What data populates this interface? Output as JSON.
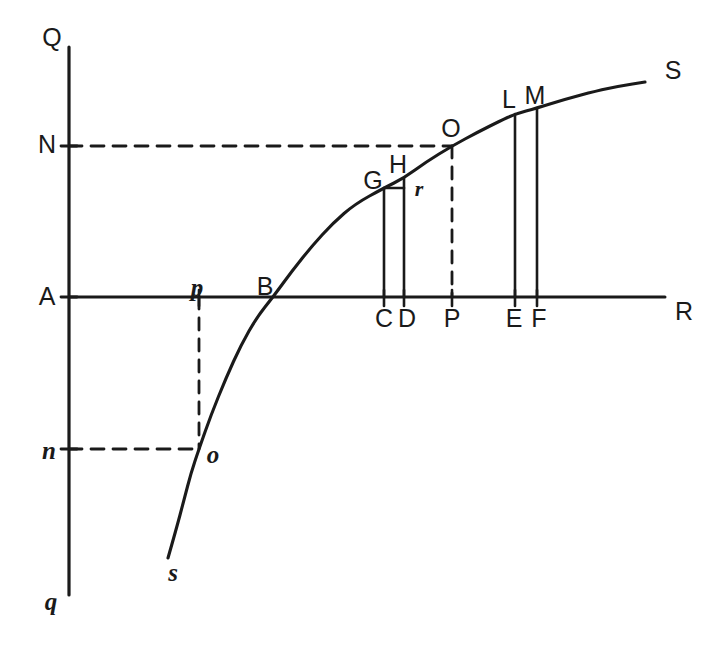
{
  "figure": {
    "stroke_color": "#1a1a1a",
    "background_color": "#ffffff",
    "width": 721,
    "height": 654
  },
  "axes": {
    "vertical": {
      "label_top": "Q",
      "label_bottom": "q",
      "x": 69,
      "y_top": 47,
      "y_bottom": 595
    },
    "horizontal": {
      "label_right": "R",
      "y": 297,
      "x_left": 69,
      "x_right": 665
    },
    "origin_label": "A"
  },
  "axis_labels": {
    "q_top": "Q",
    "q_bottom": "q",
    "r_right": "R",
    "a_origin": "A",
    "n_upper": "N",
    "n_lower": "n"
  },
  "curve": {
    "name": "ss-curve",
    "start_label": "s",
    "end_label": "S",
    "points": [
      [
        168,
        558
      ],
      [
        176,
        530
      ],
      [
        184,
        500
      ],
      [
        191,
        473
      ],
      [
        199,
        449
      ],
      [
        211,
        415
      ],
      [
        226,
        378
      ],
      [
        241,
        345
      ],
      [
        257,
        317
      ],
      [
        273,
        297
      ],
      [
        292,
        271
      ],
      [
        312,
        246
      ],
      [
        333,
        223
      ],
      [
        355,
        204
      ],
      [
        384,
        188
      ],
      [
        404,
        178
      ],
      [
        426,
        162
      ],
      [
        452,
        146
      ],
      [
        478,
        132
      ],
      [
        500,
        121
      ],
      [
        515,
        114
      ],
      [
        537,
        108
      ],
      [
        566,
        99
      ],
      [
        596,
        91
      ],
      [
        620,
        86
      ],
      [
        645,
        82
      ]
    ]
  },
  "verticals": [
    {
      "id": "C",
      "x": 384,
      "y_top": 188,
      "y_bottom": 297,
      "style": "solid",
      "label": "C",
      "label_x": 384,
      "label_y": 318
    },
    {
      "id": "D",
      "x": 404,
      "y_top": 178,
      "y_bottom": 297,
      "style": "solid",
      "label": "D",
      "label_x": 406,
      "label_y": 318
    },
    {
      "id": "P",
      "x": 452,
      "y_top": 146,
      "y_bottom": 297,
      "style": "dashed",
      "label": "P",
      "label_x": 452,
      "label_y": 318
    },
    {
      "id": "E",
      "x": 515,
      "y_top": 114,
      "y_bottom": 297,
      "style": "solid",
      "label": "E",
      "label_x": 514,
      "label_y": 318
    },
    {
      "id": "F",
      "x": 537,
      "y_top": 108,
      "y_bottom": 297,
      "style": "solid",
      "label": "F",
      "label_x": 538,
      "label_y": 318
    }
  ],
  "dashed_horizontals": [
    {
      "id": "N-line",
      "y": 146,
      "x_start": 69,
      "x_end": 452,
      "tick_label": "N"
    },
    {
      "id": "n-line",
      "y": 449,
      "x_start": 69,
      "x_end": 199,
      "tick_label": "n"
    }
  ],
  "dashed_verticals_extra": [
    {
      "id": "p-line",
      "x": 199,
      "y_top": 297,
      "y_bottom": 449,
      "tick_label": "p"
    }
  ],
  "connector_GH": {
    "x_start": 384,
    "x_end": 404,
    "y": 188,
    "label": "r"
  },
  "ticks_vertical_axis": [
    {
      "label": "N",
      "y": 146
    },
    {
      "label": "A",
      "y": 297
    },
    {
      "label": "n",
      "y": 449
    }
  ],
  "ticks_horizontal_axis": [
    {
      "label": "p",
      "x": 199
    },
    {
      "label": "C",
      "x": 384
    },
    {
      "label": "D",
      "x": 404
    },
    {
      "label": "P",
      "x": 452
    },
    {
      "label": "E",
      "x": 515
    },
    {
      "label": "F",
      "x": 537
    }
  ],
  "point_labels": [
    {
      "text": "Q",
      "x": 52,
      "y": 37,
      "style": "upper"
    },
    {
      "text": "N",
      "x": 47,
      "y": 144,
      "style": "upper"
    },
    {
      "text": "A",
      "x": 47,
      "y": 296,
      "style": "upper"
    },
    {
      "text": "n",
      "x": 49,
      "y": 450,
      "style": "lower"
    },
    {
      "text": "q",
      "x": 51,
      "y": 601,
      "style": "lower"
    },
    {
      "text": "p",
      "x": 197,
      "y": 287,
      "style": "lower"
    },
    {
      "text": "B",
      "x": 265,
      "y": 286,
      "style": "upper"
    },
    {
      "text": "o",
      "x": 213,
      "y": 454,
      "style": "lower-o"
    },
    {
      "text": "s",
      "x": 173,
      "y": 572,
      "style": "lower"
    },
    {
      "text": "G",
      "x": 373,
      "y": 180,
      "style": "upper"
    },
    {
      "text": "H",
      "x": 398,
      "y": 164,
      "style": "upper"
    },
    {
      "text": "r",
      "x": 419,
      "y": 189,
      "style": "small-r"
    },
    {
      "text": "O",
      "x": 451,
      "y": 128,
      "style": "upper"
    },
    {
      "text": "L",
      "x": 509,
      "y": 99,
      "style": "upper"
    },
    {
      "text": "M",
      "x": 535,
      "y": 95,
      "style": "upper"
    },
    {
      "text": "S",
      "x": 673,
      "y": 70,
      "style": "upper"
    },
    {
      "text": "C",
      "x": 384,
      "y": 318,
      "style": "upper"
    },
    {
      "text": "D",
      "x": 407,
      "y": 318,
      "style": "upper"
    },
    {
      "text": "P",
      "x": 452,
      "y": 318,
      "style": "upper"
    },
    {
      "text": "E",
      "x": 514,
      "y": 318,
      "style": "upper"
    },
    {
      "text": "F",
      "x": 539,
      "y": 318,
      "style": "upper"
    },
    {
      "text": "R",
      "x": 684,
      "y": 311,
      "style": "upper"
    }
  ]
}
